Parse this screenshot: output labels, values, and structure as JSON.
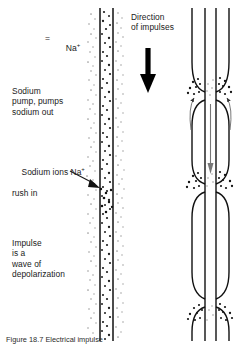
{
  "figure": {
    "legend": {
      "equals": "=",
      "symbol_label": "Na",
      "symbol_charge": "+",
      "dot_cluster_name": "sodium-ion-dot-cluster"
    },
    "labels": {
      "sodium_pump": "Sodium\npump, pumps\nsodium out",
      "sodium_rush_line1": "Sodium ions Na",
      "sodium_rush_charge": "+",
      "sodium_rush_line2": "rush in",
      "impulse": "Impulse\nis a\nwave of\ndepolarization",
      "direction": "Direction\nof impulses"
    },
    "caption": "Figure 18.7 Electrical impulse",
    "colors": {
      "ink": "#1a1a1a",
      "membrane": "#111111",
      "dot": "#222222",
      "faint_dot": "#8a8a8a",
      "arrow": "#000000",
      "background": "#ffffff"
    },
    "left_axon": {
      "name": "unmyelinated-axon",
      "membrane_x_left": 100,
      "membrane_x_right": 113,
      "top": 8,
      "bottom": 340
    },
    "right_axon": {
      "name": "myelinated-axon",
      "axon_x_left": 205,
      "axon_x_right": 216,
      "sheath_x_left": 192,
      "sheath_x_right": 229,
      "nodes_of_ranvier_y": [
        95,
        185,
        300
      ],
      "top": 8,
      "bottom": 340
    },
    "direction_arrow": {
      "name": "direction-of-impulses-arrow",
      "x": 148,
      "y_start": 48,
      "y_end": 92
    },
    "pointer_arrow": {
      "name": "sodium-rush-pointer-arrow",
      "x_start": 72,
      "y_start": 172,
      "x_end": 99,
      "y_end": 186
    }
  }
}
